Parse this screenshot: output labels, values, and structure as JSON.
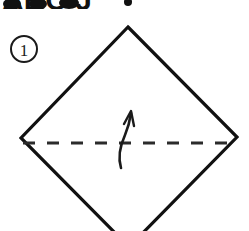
{
  "figure": {
    "name": "origami-step-diagram",
    "background_color": "#ffffff",
    "line_color": "#111111",
    "width": 249,
    "height": 231
  },
  "step_badge": {
    "label": "1",
    "shape": "circle",
    "center_x": 24,
    "center_y": 49,
    "radius": 13
  },
  "paper_shape": {
    "name": "square-rotated-diamond",
    "description": "Square sheet rotated 45 degrees, bottom corner cropped by image edge",
    "vertices": {
      "top": [
        128,
        27
      ],
      "right": [
        237,
        137
      ],
      "left": [
        21,
        138
      ],
      "bottom": [
        129,
        247
      ]
    },
    "stroke_width": 3.2
  },
  "fold_line": {
    "name": "valley-fold-dashed-line",
    "style": "dashed",
    "x_start": 23,
    "x_end": 235,
    "y": 143,
    "dash_length": 12,
    "gap_length": 12,
    "stroke_width": 3
  },
  "fold_arrow": {
    "name": "fold-up-arrow",
    "direction": "up",
    "tip_x": 131,
    "tip_y": 112,
    "tail_x": 121,
    "tail_y": 168,
    "stroke_width": 2.6
  },
  "cropped_top_text": {
    "visible": true,
    "description": "bottom fragments of bold text cropped by the top image edge",
    "value": "ABC J",
    "glyph_x_positions": [
      4,
      28,
      58,
      122
    ],
    "baseline_y": 6
  }
}
